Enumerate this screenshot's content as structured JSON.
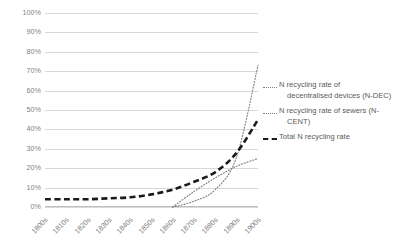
{
  "chart_data": {
    "type": "line",
    "title": "",
    "xlabel": "",
    "ylabel": "",
    "categories": [
      "1800s",
      "1810s",
      "1820s",
      "1830s",
      "1840s",
      "1850s",
      "1860s",
      "1870s",
      "1880s",
      "1890s",
      "1900s"
    ],
    "ylim": [
      0,
      100
    ],
    "y_ticks": [
      "0%",
      "10%",
      "20%",
      "30%",
      "40%",
      "50%",
      "60%",
      "70%",
      "80%",
      "90%",
      "100%"
    ],
    "y_tick_values": [
      0,
      10,
      20,
      30,
      40,
      50,
      60,
      70,
      80,
      90,
      100
    ],
    "grid": true,
    "legend_position": "right",
    "series": [
      {
        "name": "N recycling rate of decentralised devices (N-DEC)",
        "style": "dotted",
        "color": "#808080",
        "values": [
          null,
          null,
          null,
          null,
          null,
          null,
          0,
          3,
          9,
          26,
          73
        ]
      },
      {
        "name": "N recycling rate of sewers (N-CENT)",
        "style": "dotted",
        "color": "#808080",
        "values": [
          null,
          null,
          null,
          null,
          null,
          null,
          0,
          8,
          15,
          21,
          25
        ]
      },
      {
        "name": "Total N recycling rate",
        "style": "dashed-thick",
        "color": "#1a1a1a",
        "values": [
          4,
          4,
          4,
          4.5,
          5,
          6.5,
          9,
          13,
          18,
          28,
          45
        ]
      }
    ]
  },
  "legend": {
    "items": [
      {
        "label_line1": "N recycling rate of",
        "label_line2": "decentralised devices (N-DEC)",
        "key": "dotted"
      },
      {
        "label_line1": "N recycling rate of sewers (N-",
        "label_line2": "CENT)",
        "key": "dotted"
      },
      {
        "label_line1": "Total N recycling rate",
        "label_line2": "",
        "key": "dashed-thick"
      }
    ]
  }
}
